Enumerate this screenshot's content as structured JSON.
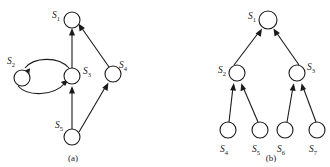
{
  "figure": {
    "caption_a": "(a)",
    "caption_b": "(b)",
    "panels": [
      {
        "id": "a",
        "caption": "(a)",
        "caption_pos": {
          "x": 73,
          "y": 160
        },
        "nodes": [
          {
            "id": "S1",
            "base": "S",
            "sub": "1",
            "cx": 72,
            "cy": 20,
            "r": 8,
            "label_x": 52,
            "label_y": 15
          },
          {
            "id": "S2",
            "base": "S",
            "sub": "2",
            "cx": 22,
            "cy": 78,
            "r": 8,
            "label_x": 7,
            "label_y": 61
          },
          {
            "id": "S3",
            "base": "S",
            "sub": "3",
            "cx": 72,
            "cy": 76,
            "r": 8,
            "label_x": 83,
            "label_y": 71
          },
          {
            "id": "S4",
            "base": "S",
            "sub": "4",
            "cx": 113,
            "cy": 74,
            "r": 8,
            "label_x": 119,
            "label_y": 65
          },
          {
            "id": "S5",
            "base": "S",
            "sub": "5",
            "cx": 72,
            "cy": 137,
            "r": 8,
            "label_x": 55,
            "label_y": 124
          }
        ],
        "edges": [
          {
            "from": "S3",
            "to": "S1",
            "type": "straight"
          },
          {
            "from": "S4",
            "to": "S1",
            "type": "straight"
          },
          {
            "from": "S5",
            "to": "S3",
            "type": "straight"
          },
          {
            "from": "S5",
            "to": "S4",
            "type": "straight"
          },
          {
            "from": "S3",
            "to": "S2",
            "type": "curved-up"
          },
          {
            "from": "S2",
            "to": "S3",
            "type": "curved-down"
          }
        ]
      },
      {
        "id": "b",
        "caption": "(b)",
        "caption_pos": {
          "x": 271,
          "y": 160
        },
        "nodes": [
          {
            "id": "S1",
            "base": "S",
            "sub": "1",
            "cx": 268,
            "cy": 20,
            "r": 9,
            "label_x": 248,
            "label_y": 16
          },
          {
            "id": "S2",
            "base": "S",
            "sub": "2",
            "cx": 237,
            "cy": 73,
            "r": 8,
            "label_x": 218,
            "label_y": 70
          },
          {
            "id": "S3",
            "base": "S",
            "sub": "3",
            "cx": 297,
            "cy": 73,
            "r": 8,
            "label_x": 307,
            "label_y": 67
          },
          {
            "id": "S4",
            "base": "S",
            "sub": "4",
            "cx": 228,
            "cy": 130,
            "r": 8,
            "label_x": 220,
            "label_y": 150
          },
          {
            "id": "S5",
            "base": "S",
            "sub": "5",
            "cx": 260,
            "cy": 130,
            "r": 8,
            "label_x": 252,
            "label_y": 150
          },
          {
            "id": "S6",
            "base": "S",
            "sub": "6",
            "cx": 285,
            "cy": 130,
            "r": 8,
            "label_x": 277,
            "label_y": 150
          },
          {
            "id": "S7",
            "base": "S",
            "sub": "7",
            "cx": 317,
            "cy": 130,
            "r": 8,
            "label_x": 309,
            "label_y": 150
          }
        ],
        "edges": [
          {
            "from": "S2",
            "to": "S1",
            "type": "straight"
          },
          {
            "from": "S3",
            "to": "S1",
            "type": "straight"
          },
          {
            "from": "S4",
            "to": "S2",
            "type": "straight"
          },
          {
            "from": "S5",
            "to": "S2",
            "type": "straight"
          },
          {
            "from": "S6",
            "to": "S3",
            "type": "straight"
          },
          {
            "from": "S7",
            "to": "S3",
            "type": "straight"
          }
        ]
      }
    ],
    "colors": {
      "stroke": "#1a1a1a",
      "node_fill": "#ffffff",
      "background": "#ffffff"
    }
  }
}
